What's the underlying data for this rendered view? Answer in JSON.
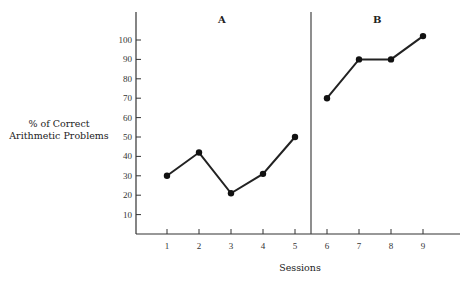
{
  "chart_data": {
    "type": "line",
    "title": "",
    "xlabel": "Sessions",
    "ylabel": "% of Correct Arithmetic Problems",
    "x_ticks": [
      1,
      2,
      3,
      4,
      5,
      6,
      7,
      8,
      9
    ],
    "y_ticks": [
      10,
      20,
      30,
      40,
      50,
      60,
      70,
      80,
      90,
      100
    ],
    "ylim": [
      0,
      110
    ],
    "phases": [
      {
        "label": "A",
        "sessions": [
          1,
          2,
          3,
          4,
          5
        ],
        "values": [
          30,
          42,
          21,
          31,
          50
        ]
      },
      {
        "label": "B",
        "sessions": [
          6,
          7,
          8,
          9
        ],
        "values": [
          70,
          90,
          90,
          102
        ]
      }
    ],
    "phase_change_between": [
      5,
      6
    ],
    "grid": false,
    "legend": null
  },
  "labels": {
    "ylabel_line1": "% of Correct",
    "ylabel_line2": "Arithmetic Problems",
    "xlabel": "Sessions",
    "phase_a": "A",
    "phase_b": "B"
  }
}
